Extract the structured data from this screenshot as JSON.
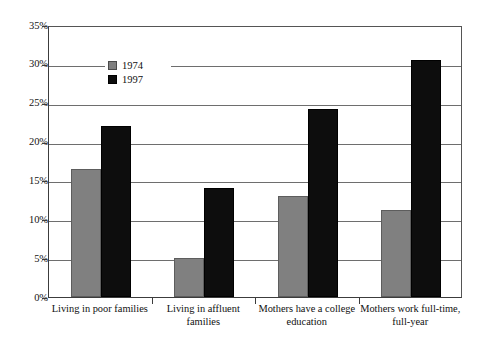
{
  "chart_data": {
    "type": "bar",
    "title": "",
    "subtitle": "",
    "xlabel": "",
    "ylabel": "",
    "ylim": [
      0,
      35
    ],
    "ytick_labels": [
      "35%",
      "30%",
      "25%",
      "20%",
      "15%",
      "10%",
      "5%",
      "0%"
    ],
    "ytick_values": [
      35,
      30,
      25,
      20,
      15,
      10,
      5,
      0
    ],
    "grid": true,
    "legend_position": "top-left",
    "categories": [
      "Living in poor families",
      "Living in affluent families",
      "Mothers have a college education",
      "Mothers work full-time, full-year"
    ],
    "category_lines": [
      [
        "Living in poor families"
      ],
      [
        "Living in affluent",
        "families"
      ],
      [
        "Mothers have a college",
        "education"
      ],
      [
        "Mothers work full-time,",
        "full-year"
      ]
    ],
    "series": [
      {
        "name": "1974",
        "color": "#808080",
        "values": [
          16.5,
          5.0,
          13.0,
          11.2
        ]
      },
      {
        "name": "1997",
        "color": "#0d0d0d",
        "values": [
          22.0,
          14.0,
          24.2,
          30.5
        ]
      }
    ]
  },
  "legend": {
    "items": [
      {
        "label": "1974",
        "swatch": "gray-square-icon"
      },
      {
        "label": "1997",
        "swatch": "black-square-icon"
      }
    ]
  }
}
